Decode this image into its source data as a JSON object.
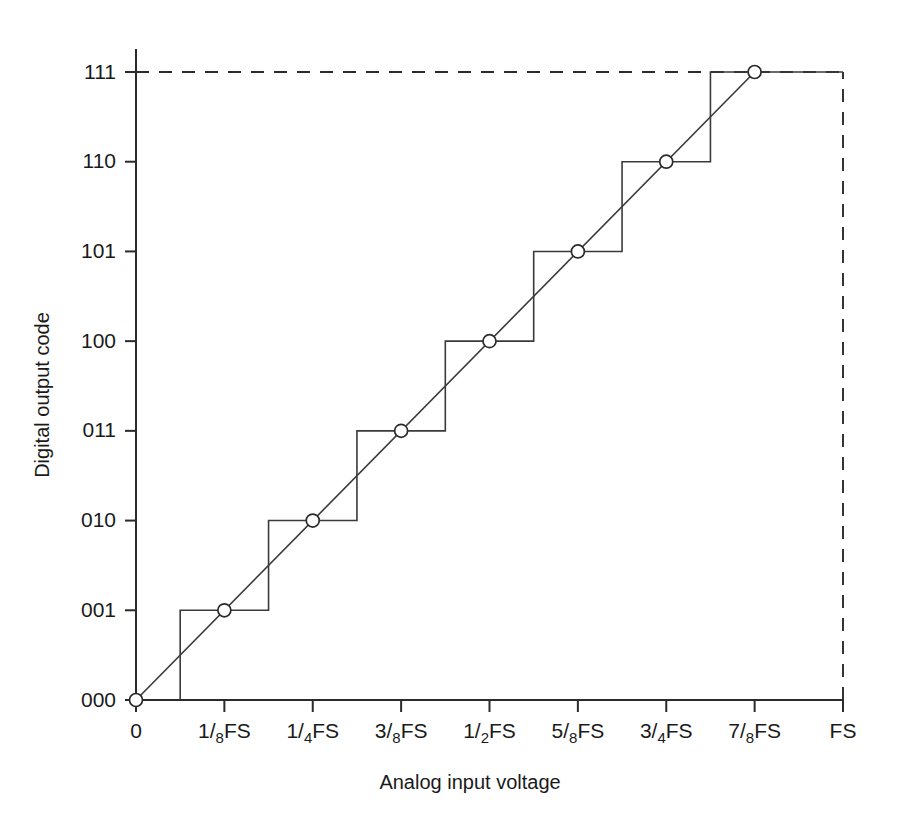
{
  "chart_data": {
    "type": "line",
    "title": "",
    "subtitle": "",
    "xlabel": "Analog input voltage",
    "ylabel": "Digital output code",
    "grid": false,
    "legend": "none",
    "xlim": [
      0,
      1
    ],
    "ylim": [
      0,
      7
    ],
    "x_tick_values": [
      0,
      0.125,
      0.25,
      0.375,
      0.5,
      0.625,
      0.75,
      0.875,
      1
    ],
    "x_tick_labels": [
      "0",
      "1/8FS",
      "1/4FS",
      "3/8FS",
      "1/2FS",
      "5/8FS",
      "3/4FS",
      "7/8FS",
      "FS"
    ],
    "x_ticks": [
      {
        "label": "0",
        "numerator": "",
        "denominator": "",
        "suffix": "0",
        "value": 0
      },
      {
        "label": "1/8FS",
        "numerator": "1",
        "denominator": "8",
        "suffix": "FS",
        "value": 0.125
      },
      {
        "label": "1/4FS",
        "numerator": "1",
        "denominator": "4",
        "suffix": "FS",
        "value": 0.25
      },
      {
        "label": "3/8FS",
        "numerator": "3",
        "denominator": "8",
        "suffix": "FS",
        "value": 0.375
      },
      {
        "label": "1/2FS",
        "numerator": "1",
        "denominator": "2",
        "suffix": "FS",
        "value": 0.5
      },
      {
        "label": "5/8FS",
        "numerator": "5",
        "denominator": "8",
        "suffix": "FS",
        "value": 0.625
      },
      {
        "label": "3/4FS",
        "numerator": "3",
        "denominator": "4",
        "suffix": "FS",
        "value": 0.75
      },
      {
        "label": "7/8FS",
        "numerator": "7",
        "denominator": "8",
        "suffix": "FS",
        "value": 0.875
      },
      {
        "label": "FS",
        "numerator": "",
        "denominator": "",
        "suffix": "FS",
        "value": 1
      }
    ],
    "y_tick_labels": [
      "000",
      "001",
      "010",
      "011",
      "100",
      "101",
      "110",
      "111"
    ],
    "y_tick_values": [
      0,
      1,
      2,
      3,
      4,
      5,
      6,
      7
    ],
    "series": [
      {
        "name": "Quantized transfer function",
        "style": "staircase",
        "transitions_x": [
          0.0625,
          0.1875,
          0.3125,
          0.4375,
          0.5625,
          0.6875,
          0.8125
        ],
        "levels": [
          0,
          1,
          2,
          3,
          4,
          5,
          6,
          7
        ],
        "x_start": 0,
        "x_end": 1
      },
      {
        "name": "Ideal straight line",
        "style": "line",
        "x": [
          0,
          0.875
        ],
        "y": [
          0,
          7
        ]
      },
      {
        "name": "Code center points",
        "style": "markers",
        "x": [
          0,
          0.125,
          0.25,
          0.375,
          0.5,
          0.625,
          0.75,
          0.875
        ],
        "y": [
          0,
          1,
          2,
          3,
          4,
          5,
          6,
          7
        ]
      }
    ],
    "annotations": [
      {
        "name": "full-scale-top-guide",
        "style": "dashed-horizontal",
        "y": 7,
        "x_from": 0,
        "x_to": 1
      },
      {
        "name": "full-scale-right-guide",
        "style": "dashed-vertical",
        "x": 1,
        "y_from": 0,
        "y_to": 7
      }
    ],
    "colors": {
      "line": "#3a3a3a",
      "axis": "#2b2b2b",
      "marker_fill": "#ffffff",
      "background": "#ffffff"
    }
  }
}
